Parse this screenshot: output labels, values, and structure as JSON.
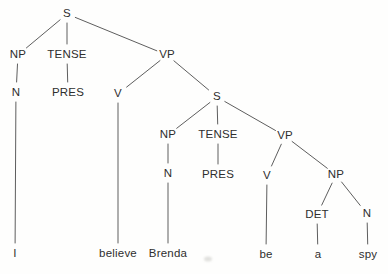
{
  "figure": {
    "sentence": "I believe Brenda be a spy",
    "background_color": "#fefefd",
    "text_color": "#2e2e2e",
    "line_color": "#5e5e5e",
    "artifact_dot": {
      "x": 208,
      "y": 259,
      "color": "#c9c9c4"
    }
  },
  "tree": {
    "nodes": [
      {
        "id": "s1",
        "label": "S",
        "kind": "category",
        "x": 67,
        "y": 14
      },
      {
        "id": "np1",
        "label": "NP",
        "kind": "category",
        "x": 18,
        "y": 55
      },
      {
        "id": "tense1",
        "label": "TENSE",
        "kind": "category",
        "x": 67,
        "y": 55
      },
      {
        "id": "vp1",
        "label": "VP",
        "kind": "category",
        "x": 167,
        "y": 55
      },
      {
        "id": "n1",
        "label": "N",
        "kind": "category",
        "x": 16,
        "y": 93
      },
      {
        "id": "pres1",
        "label": "PRES",
        "kind": "category",
        "x": 68,
        "y": 93
      },
      {
        "id": "v1",
        "label": "V",
        "kind": "category",
        "x": 118,
        "y": 94
      },
      {
        "id": "s2",
        "label": "S",
        "kind": "category",
        "x": 217,
        "y": 97
      },
      {
        "id": "np2",
        "label": "NP",
        "kind": "category",
        "x": 168,
        "y": 135
      },
      {
        "id": "tense2",
        "label": "TENSE",
        "kind": "category",
        "x": 218,
        "y": 135
      },
      {
        "id": "vp2",
        "label": "VP",
        "kind": "category",
        "x": 285,
        "y": 136
      },
      {
        "id": "n2",
        "label": "N",
        "kind": "category",
        "x": 168,
        "y": 174
      },
      {
        "id": "pres2",
        "label": "PRES",
        "kind": "category",
        "x": 218,
        "y": 175
      },
      {
        "id": "v2",
        "label": "V",
        "kind": "category",
        "x": 267,
        "y": 176
      },
      {
        "id": "np3",
        "label": "NP",
        "kind": "category",
        "x": 336,
        "y": 175
      },
      {
        "id": "det1",
        "label": "DET",
        "kind": "category",
        "x": 317,
        "y": 215
      },
      {
        "id": "n3",
        "label": "N",
        "kind": "category",
        "x": 367,
        "y": 214
      },
      {
        "id": "w_i",
        "label": "I",
        "kind": "word",
        "x": 15,
        "y": 254
      },
      {
        "id": "w_believe",
        "label": "believe",
        "kind": "word",
        "x": 118,
        "y": 254
      },
      {
        "id": "w_brenda",
        "label": "Brenda",
        "kind": "word",
        "x": 168,
        "y": 254
      },
      {
        "id": "w_be",
        "label": "be",
        "kind": "word",
        "x": 266,
        "y": 255
      },
      {
        "id": "w_a",
        "label": "a",
        "kind": "word",
        "x": 318,
        "y": 255
      },
      {
        "id": "w_spy",
        "label": "spy",
        "kind": "word",
        "x": 368,
        "y": 255
      }
    ],
    "edges": [
      [
        "s1",
        "np1"
      ],
      [
        "s1",
        "tense1"
      ],
      [
        "s1",
        "vp1"
      ],
      [
        "np1",
        "n1"
      ],
      [
        "tense1",
        "pres1"
      ],
      [
        "vp1",
        "v1"
      ],
      [
        "vp1",
        "s2"
      ],
      [
        "n1",
        "w_i"
      ],
      [
        "v1",
        "w_believe"
      ],
      [
        "s2",
        "np2"
      ],
      [
        "s2",
        "tense2"
      ],
      [
        "s2",
        "vp2"
      ],
      [
        "np2",
        "n2"
      ],
      [
        "tense2",
        "pres2"
      ],
      [
        "n2",
        "w_brenda"
      ],
      [
        "vp2",
        "v2"
      ],
      [
        "vp2",
        "np3"
      ],
      [
        "v2",
        "w_be"
      ],
      [
        "np3",
        "det1"
      ],
      [
        "np3",
        "n3"
      ],
      [
        "det1",
        "w_a"
      ],
      [
        "n3",
        "w_spy"
      ]
    ]
  }
}
